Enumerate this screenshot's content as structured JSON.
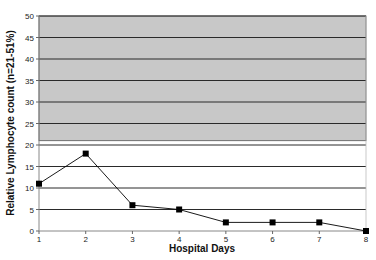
{
  "chart_data": {
    "type": "line",
    "title": "",
    "xlabel": "Hospital Days",
    "ylabel": "Relative Lymphocyte count (n=21-51%)",
    "x": [
      1,
      2,
      3,
      4,
      5,
      6,
      7,
      8
    ],
    "series": [
      {
        "name": "Relative Lymphocyte count",
        "values": [
          11,
          18,
          6,
          5,
          2,
          2,
          2,
          0
        ],
        "marker": "square",
        "color": "#000000"
      }
    ],
    "ylim": [
      0,
      50
    ],
    "xlim": [
      1,
      8
    ],
    "yticks": [
      0,
      5,
      10,
      15,
      20,
      25,
      30,
      35,
      40,
      45,
      50
    ],
    "xticks": [
      1,
      2,
      3,
      4,
      5,
      6,
      7,
      8
    ],
    "grid": true,
    "legend": null,
    "shaded_band": {
      "from": 21,
      "to": 50,
      "color": "#c8c8c8",
      "label": "normal range (21-51%)"
    }
  }
}
